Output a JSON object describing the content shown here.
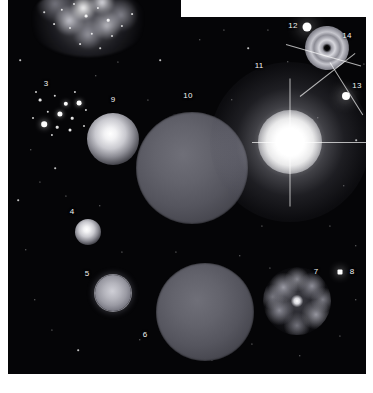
{
  "figure": {
    "background_color": "#ffffff",
    "sky_color": "#050507",
    "label_color": "#f2f2f2",
    "plate_shape": "stepped-notch-top-right",
    "plates": [
      {
        "name": "left-plate",
        "x": 8,
        "y": 0,
        "width": 173,
        "height": 374
      },
      {
        "name": "right-plate",
        "x": 180,
        "y": 17,
        "width": 186,
        "height": 357
      }
    ]
  },
  "objects": [
    {
      "id": "3",
      "name": "open-star-cluster",
      "label": "3",
      "label_x": 46,
      "label_y": 84,
      "center_x": 62,
      "center_y": 112,
      "size": 74,
      "kind": "star-cluster"
    },
    {
      "id": "4",
      "name": "small-glowing-sphere",
      "label": "4",
      "label_x": 72,
      "label_y": 212,
      "center_x": 88,
      "center_y": 232,
      "size": 26,
      "kind": "glow-ball"
    },
    {
      "id": "5",
      "name": "ringed-sphere",
      "label": "5",
      "label_x": 87,
      "label_y": 274,
      "center_x": 113,
      "center_y": 293,
      "size": 36,
      "kind": "ringed-sphere"
    },
    {
      "id": "6",
      "name": "large-dim-sphere-lower",
      "label": "6",
      "label_x": 145,
      "label_y": 335,
      "center_x": 205,
      "center_y": 312,
      "size": 98,
      "kind": "dim-disc"
    },
    {
      "id": "7",
      "name": "clumpy-irregular-galaxy",
      "label": "7",
      "label_x": 316,
      "label_y": 272,
      "center_x": 297,
      "center_y": 301,
      "size": 68,
      "kind": "clumpy-galaxy"
    },
    {
      "id": "8",
      "name": "compact-star-point",
      "label": "8",
      "label_x": 352,
      "label_y": 272,
      "center_x": 340,
      "center_y": 272,
      "size": 5,
      "kind": "point-star"
    },
    {
      "id": "9",
      "name": "bright-glowing-sphere",
      "label": "9",
      "label_x": 113,
      "label_y": 100,
      "center_x": 113,
      "center_y": 139,
      "size": 52,
      "kind": "glow-ball"
    },
    {
      "id": "10",
      "name": "large-dim-sphere-upper",
      "label": "10",
      "label_x": 188,
      "label_y": 96,
      "center_x": 192,
      "center_y": 168,
      "size": 112,
      "kind": "dim-disc"
    },
    {
      "id": "11",
      "name": "starburst-halo",
      "label": "11",
      "label_x": 259,
      "label_y": 66,
      "center_x": 290,
      "center_y": 142,
      "size": 160,
      "kind": "starburst"
    },
    {
      "id": "12",
      "name": "bright-compact-star",
      "label": "12",
      "label_x": 293,
      "label_y": 26,
      "center_x": 307,
      "center_y": 27,
      "size": 9,
      "kind": "point-star"
    },
    {
      "id": "13",
      "name": "spiked-bright-star",
      "label": "13",
      "label_x": 357,
      "label_y": 86,
      "center_x": 346,
      "center_y": 96,
      "size": 8,
      "kind": "spiked-star"
    },
    {
      "id": "14",
      "name": "ring-galaxy",
      "label": "14",
      "label_x": 347,
      "label_y": 36,
      "center_x": 327,
      "center_y": 48,
      "size": 44,
      "kind": "ring-galaxy"
    }
  ],
  "nebula": {
    "name": "bright-clumpy-nebula",
    "center_x": 88,
    "center_y": 22,
    "width": 118,
    "height": 70
  },
  "spikes": [
    {
      "name": "spike-a",
      "x": 286,
      "y": 44,
      "length": 78,
      "angle": 16
    },
    {
      "name": "spike-b",
      "x": 300,
      "y": 96,
      "length": 70,
      "angle": -38
    },
    {
      "name": "spike-c",
      "x": 330,
      "y": 62,
      "length": 62,
      "angle": 58
    },
    {
      "name": "spike-d",
      "x": 252,
      "y": 142,
      "length": 120,
      "angle": 0
    },
    {
      "name": "spike-e",
      "x": 290,
      "y": 78,
      "length": 128,
      "angle": 90
    }
  ],
  "cluster_stars": [
    {
      "x": 40,
      "y": 100,
      "r": 1.4
    },
    {
      "x": 55,
      "y": 96,
      "r": 1.2
    },
    {
      "x": 66,
      "y": 104,
      "r": 2.2
    },
    {
      "x": 79,
      "y": 103,
      "r": 2.4
    },
    {
      "x": 48,
      "y": 112,
      "r": 1.2
    },
    {
      "x": 60,
      "y": 114,
      "r": 2.6
    },
    {
      "x": 72,
      "y": 118,
      "r": 1.3
    },
    {
      "x": 86,
      "y": 110,
      "r": 1.1
    },
    {
      "x": 44,
      "y": 124,
      "r": 2.8
    },
    {
      "x": 57,
      "y": 127,
      "r": 1.3
    },
    {
      "x": 70,
      "y": 130,
      "r": 1.5
    },
    {
      "x": 33,
      "y": 118,
      "r": 1.0
    },
    {
      "x": 84,
      "y": 126,
      "r": 1.0
    },
    {
      "x": 52,
      "y": 135,
      "r": 1.1
    },
    {
      "x": 36,
      "y": 92,
      "r": 1.0
    },
    {
      "x": 75,
      "y": 92,
      "r": 1.1
    }
  ],
  "field_stars": [
    {
      "x": 20,
      "y": 60,
      "r": 0.8
    },
    {
      "x": 31,
      "y": 150,
      "r": 0.7
    },
    {
      "x": 18,
      "y": 200,
      "r": 0.8
    },
    {
      "x": 26,
      "y": 250,
      "r": 0.7
    },
    {
      "x": 40,
      "y": 182,
      "r": 0.6
    },
    {
      "x": 55,
      "y": 168,
      "r": 0.8
    },
    {
      "x": 66,
      "y": 196,
      "r": 0.6
    },
    {
      "x": 35,
      "y": 300,
      "r": 0.7
    },
    {
      "x": 52,
      "y": 330,
      "r": 0.6
    },
    {
      "x": 78,
      "y": 350,
      "r": 0.8
    },
    {
      "x": 100,
      "y": 206,
      "r": 0.7
    },
    {
      "x": 122,
      "y": 252,
      "r": 0.6
    },
    {
      "x": 140,
      "y": 340,
      "r": 0.7
    },
    {
      "x": 160,
      "y": 60,
      "r": 0.8
    },
    {
      "x": 148,
      "y": 100,
      "r": 0.6
    },
    {
      "x": 96,
      "y": 76,
      "r": 0.7
    },
    {
      "x": 118,
      "y": 62,
      "r": 0.6
    },
    {
      "x": 200,
      "y": 40,
      "r": 0.7
    },
    {
      "x": 224,
      "y": 30,
      "r": 0.6
    },
    {
      "x": 248,
      "y": 48,
      "r": 0.8
    },
    {
      "x": 268,
      "y": 30,
      "r": 0.6
    },
    {
      "x": 288,
      "y": 62,
      "r": 0.7
    },
    {
      "x": 356,
      "y": 140,
      "r": 0.8
    },
    {
      "x": 344,
      "y": 186,
      "r": 0.7
    },
    {
      "x": 330,
      "y": 226,
      "r": 0.6
    },
    {
      "x": 356,
      "y": 246,
      "r": 0.7
    },
    {
      "x": 262,
      "y": 226,
      "r": 0.6
    },
    {
      "x": 240,
      "y": 256,
      "r": 0.7
    },
    {
      "x": 252,
      "y": 344,
      "r": 0.6
    },
    {
      "x": 300,
      "y": 356,
      "r": 0.7
    },
    {
      "x": 340,
      "y": 336,
      "r": 0.6
    },
    {
      "x": 356,
      "y": 300,
      "r": 0.7
    },
    {
      "x": 212,
      "y": 360,
      "r": 0.6
    },
    {
      "x": 176,
      "y": 252,
      "r": 0.6
    },
    {
      "x": 232,
      "y": 100,
      "r": 0.7
    },
    {
      "x": 216,
      "y": 206,
      "r": 0.6
    },
    {
      "x": 270,
      "y": 268,
      "r": 0.6
    },
    {
      "x": 318,
      "y": 118,
      "r": 0.7
    },
    {
      "x": 364,
      "y": 64,
      "r": 0.6
    },
    {
      "x": 196,
      "y": 300,
      "r": 0.6
    }
  ],
  "nebula_stars": [
    {
      "x": 62,
      "y": 10,
      "r": 1.2
    },
    {
      "x": 74,
      "y": 4,
      "r": 1.0
    },
    {
      "x": 86,
      "y": 16,
      "r": 1.4
    },
    {
      "x": 98,
      "y": 8,
      "r": 1.1
    },
    {
      "x": 108,
      "y": 20,
      "r": 1.3
    },
    {
      "x": 70,
      "y": 28,
      "r": 1.0
    },
    {
      "x": 92,
      "y": 34,
      "r": 1.2
    },
    {
      "x": 112,
      "y": 36,
      "r": 1.0
    },
    {
      "x": 54,
      "y": 24,
      "r": 0.9
    },
    {
      "x": 122,
      "y": 26,
      "r": 1.1
    },
    {
      "x": 80,
      "y": 44,
      "r": 0.9
    },
    {
      "x": 100,
      "y": 48,
      "r": 0.8
    },
    {
      "x": 132,
      "y": 14,
      "r": 0.9
    },
    {
      "x": 44,
      "y": 12,
      "r": 0.8
    }
  ]
}
